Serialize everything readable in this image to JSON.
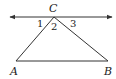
{
  "diagram": {
    "points": {
      "A": {
        "label": "A",
        "x": 16,
        "y": 61
      },
      "B": {
        "label": "B",
        "x": 108,
        "y": 61
      },
      "C": {
        "label": "C",
        "x": 54,
        "y": 17
      }
    },
    "line_through_C": {
      "x1": 10,
      "x2": 112,
      "y": 17,
      "arrows": "both"
    },
    "angles": [
      {
        "label": "1",
        "x": 40,
        "y": 27
      },
      {
        "label": "2",
        "x": 53,
        "y": 30
      },
      {
        "label": "3",
        "x": 74,
        "y": 27
      }
    ],
    "stroke_color": "#333333"
  }
}
